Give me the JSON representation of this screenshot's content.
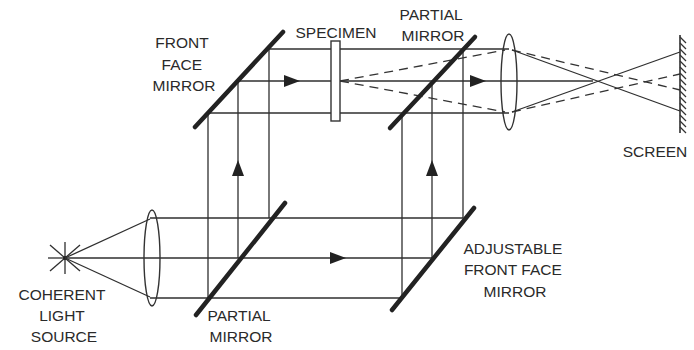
{
  "diagram": {
    "type": "holographic interferometer optical setup",
    "labels": {
      "front_face_mirror": [
        "FRONT",
        "FACE",
        "MIRROR"
      ],
      "specimen": [
        "SPECIMEN"
      ],
      "partial_mirror_top": [
        "PARTIAL",
        "MIRROR"
      ],
      "screen": [
        "SCREEN"
      ],
      "coherent_light_source": [
        "COHERENT",
        "LIGHT",
        "SOURCE"
      ],
      "partial_mirror_bottom": [
        "PARTIAL",
        "MIRROR"
      ],
      "adjustable_front_face_mirror": [
        "ADJUSTABLE",
        "FRONT FACE",
        "MIRROR"
      ]
    },
    "colors": {
      "line": "#2f2f2f",
      "background": "#ffffff",
      "text": "#2a2a2a"
    },
    "components": [
      "coherent-light-source",
      "collimating-lens",
      "partial-mirror-bottom",
      "adjustable-front-face-mirror",
      "front-face-mirror",
      "specimen",
      "partial-mirror-top",
      "imaging-lens",
      "screen"
    ]
  }
}
